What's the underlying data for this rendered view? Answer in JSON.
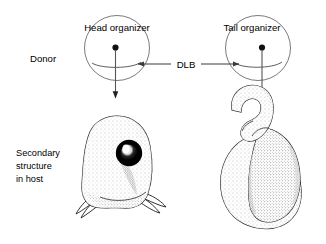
{
  "figure": {
    "background_color": "#ffffff",
    "ink_color": "#000000",
    "row_labels": {
      "donor": "Donor",
      "secondary_line1": "Secondary",
      "secondary_line2": "structure",
      "secondary_line3": "in host"
    },
    "donor_row": {
      "left": {
        "label": "Head organizer",
        "icon_name": "head-organizer-circle",
        "rotation_direction": "leftward-arc"
      },
      "right": {
        "label": "Tail organizer",
        "icon_name": "tail-organizer-circle",
        "rotation_direction": "rightward-arc"
      },
      "connector": {
        "label": "DLB",
        "arrow_style": "double-headed"
      }
    },
    "result_row": {
      "left": {
        "caption": "secondary head structure with eye",
        "icon_name": "secondary-head-embryo"
      },
      "right": {
        "caption": "secondary tail structure",
        "icon_name": "secondary-tail-embryo"
      }
    }
  }
}
